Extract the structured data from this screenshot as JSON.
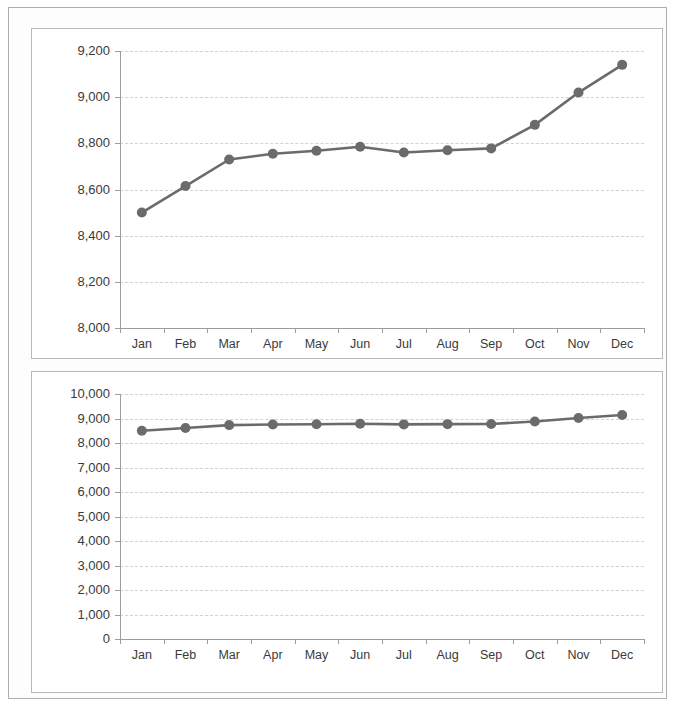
{
  "chart_data": [
    {
      "type": "line",
      "title": "",
      "xlabel": "",
      "ylabel": "",
      "categories": [
        "Jan",
        "Feb",
        "Mar",
        "Apr",
        "May",
        "Jun",
        "Jul",
        "Aug",
        "Sep",
        "Oct",
        "Nov",
        "Dec"
      ],
      "values": [
        8500,
        8615,
        8730,
        8755,
        8768,
        8785,
        8760,
        8770,
        8778,
        8880,
        9020,
        9140
      ],
      "ylim": [
        8000,
        9200
      ],
      "ytick_step": 200,
      "ytick_labels": [
        "9,200",
        "9,000",
        "8,800",
        "8,600",
        "8,400",
        "8,200",
        "8,000"
      ],
      "ytick_values": [
        9200,
        9000,
        8800,
        8600,
        8400,
        8200,
        8000
      ],
      "grid": true,
      "legend": "none",
      "series_color": "#6b6b6b",
      "marker": "circle"
    },
    {
      "type": "line",
      "title": "",
      "xlabel": "",
      "ylabel": "",
      "categories": [
        "Jan",
        "Feb",
        "Mar",
        "Apr",
        "May",
        "Jun",
        "Jul",
        "Aug",
        "Sep",
        "Oct",
        "Nov",
        "Dec"
      ],
      "values": [
        8500,
        8615,
        8730,
        8755,
        8768,
        8785,
        8760,
        8770,
        8778,
        8880,
        9020,
        9140
      ],
      "ylim": [
        0,
        10000
      ],
      "ytick_step": 1000,
      "ytick_labels": [
        "10,000",
        "9,000",
        "8,000",
        "7,000",
        "6,000",
        "5,000",
        "4,000",
        "3,000",
        "2,000",
        "1,000",
        "0"
      ],
      "ytick_values": [
        10000,
        9000,
        8000,
        7000,
        6000,
        5000,
        4000,
        3000,
        2000,
        1000,
        0
      ],
      "grid": true,
      "legend": "none",
      "series_color": "#6b6b6b",
      "marker": "circle"
    }
  ],
  "colors": {
    "series": "#6b6b6b",
    "gridline": "#d2d2d2",
    "axis": "#9d9d9d",
    "panel_border": "#b9b9b9",
    "outer_border": "#adadad",
    "text": "#3a3a3a",
    "background": "#ffffff"
  }
}
